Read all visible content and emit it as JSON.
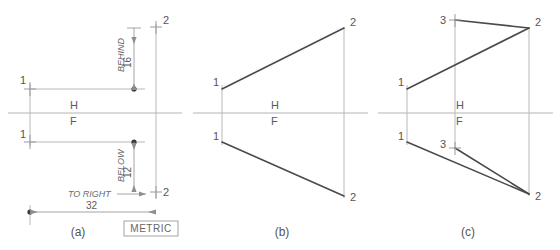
{
  "figure": {
    "units_badge": "METRIC",
    "fold_line_upper_label": "H",
    "fold_line_lower_label": "F",
    "colors": {
      "object_line": "#4a4a4a",
      "fold_line": "#b4b4b4",
      "projection_line": "#b8b8b8",
      "dimension_line": "#8e8e8e",
      "text": "#555555",
      "background": "#ffffff"
    },
    "panels": [
      {
        "id": "a",
        "caption": "(a)",
        "point_labels": [
          "1",
          "1",
          "2",
          "2"
        ],
        "dimensions": [
          {
            "name": "behind",
            "text": "BEHIND",
            "value": "16",
            "orientation": "vertical"
          },
          {
            "name": "below",
            "text": "BELOW",
            "value": "12",
            "orientation": "vertical"
          },
          {
            "name": "to-right",
            "text": "TO RIGHT",
            "value": "32",
            "orientation": "horizontal"
          }
        ],
        "fold_labels": {
          "upper": "H",
          "lower": "F"
        }
      },
      {
        "id": "b",
        "caption": "(b)",
        "point_labels": [
          "1",
          "1",
          "2",
          "2"
        ],
        "fold_labels": {
          "upper": "H",
          "lower": "F"
        }
      },
      {
        "id": "c",
        "caption": "(c)",
        "point_labels": [
          "1",
          "1",
          "2",
          "2",
          "3",
          "3"
        ],
        "fold_labels": {
          "upper": "H",
          "lower": "F"
        }
      }
    ]
  }
}
